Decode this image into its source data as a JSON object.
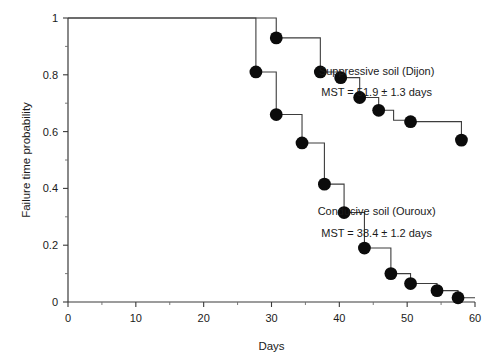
{
  "chart_data": {
    "type": "line",
    "title": "",
    "xlabel": "Days",
    "ylabel": "Failure time probability",
    "xlim": [
      0,
      60
    ],
    "ylim": [
      0,
      1
    ],
    "grid": false,
    "legend_position": "inside-right",
    "x_ticks": [
      0,
      10,
      20,
      30,
      40,
      50,
      60
    ],
    "x_tick_labels": [
      "0",
      "10",
      "20",
      "30",
      "40",
      "50",
      "60"
    ],
    "x_minor_ticks": [
      5,
      15,
      25,
      35,
      45,
      55
    ],
    "y_ticks": [
      0,
      0.2,
      0.4,
      0.6,
      0.8,
      1
    ],
    "y_tick_labels": [
      "0",
      "0.2",
      "0.4",
      "0.6",
      "0.8",
      "1"
    ],
    "y_minor_ticks": [
      0.1,
      0.3,
      0.5,
      0.7,
      0.9
    ],
    "series": [
      {
        "name": "Suppressive soil (Dijon)",
        "style": "step-post-with-markers",
        "x": [
          0,
          30.7,
          37.2,
          40.2,
          43.0,
          45.8,
          48.0,
          50.5,
          58.0
        ],
        "y": [
          1.0,
          0.93,
          0.81,
          0.79,
          0.72,
          0.675,
          0.64,
          0.635,
          0.57
        ],
        "marker_x": [
          30.7,
          37.2,
          40.2,
          43.0,
          45.8,
          50.5,
          58.0
        ],
        "marker_y": [
          0.93,
          0.81,
          0.79,
          0.72,
          0.675,
          0.635,
          0.57
        ]
      },
      {
        "name": "Conducive soil (Ouroux)",
        "style": "step-post-with-markers",
        "x": [
          0,
          27.7,
          30.7,
          34.5,
          37.8,
          40.7,
          43.7,
          47.6,
          50.5,
          54.4,
          57.5
        ],
        "y": [
          1.0,
          0.81,
          0.66,
          0.56,
          0.415,
          0.315,
          0.19,
          0.1,
          0.065,
          0.04,
          0.015
        ],
        "marker_x": [
          27.7,
          30.7,
          34.5,
          37.8,
          40.7,
          43.7,
          47.6,
          50.5,
          54.4,
          57.5
        ],
        "marker_y": [
          0.81,
          0.66,
          0.56,
          0.415,
          0.315,
          0.19,
          0.1,
          0.065,
          0.04,
          0.015
        ]
      }
    ],
    "annotations": [
      {
        "id": "suppressive-label",
        "text": "Suppressive soil (Dijon)",
        "x": 45.5,
        "y": 0.8
      },
      {
        "id": "suppressive-mst",
        "text": "MST = 51.9 ± 1.3 days",
        "x": 45.5,
        "y": 0.725
      },
      {
        "id": "conducive-label",
        "text": "Conducive soil (Ouroux)",
        "x": 45.5,
        "y": 0.305
      },
      {
        "id": "conducive-mst",
        "text": "MST = 38.4 ± 1.2 days",
        "x": 45.5,
        "y": 0.228
      }
    ],
    "colors": {
      "line": "#3d3d3d",
      "marker": "#0b0b0b",
      "axis": "#3a3a3a",
      "text": "#1a1a1a",
      "background": "#ffffff"
    }
  }
}
